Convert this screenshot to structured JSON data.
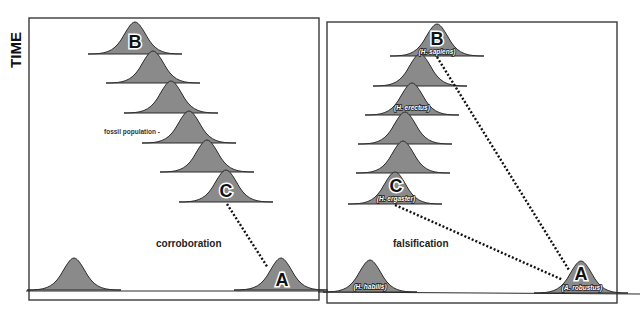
{
  "axis": {
    "y_label": "TIME"
  },
  "left_panel": {
    "caption": "corroboration",
    "annotation": "fossil population -",
    "labels": {
      "top": "B",
      "middle": "C",
      "bottom_right": "A"
    }
  },
  "right_panel": {
    "caption": "falsification",
    "labels": {
      "top": "B",
      "top_taxon": "(H. sapiens)",
      "third_taxon": "(H. erectus)",
      "middle": "C",
      "middle_taxon": "(H. ergaster)",
      "bottom_left_taxon": "(H. habilis)",
      "bottom_right": "A",
      "bottom_right_taxon": "(A. robustus)"
    }
  },
  "colors": {
    "population_fill": "#8a8a8a",
    "outline": "#2a2a2a",
    "dotted_line": "#111111"
  }
}
